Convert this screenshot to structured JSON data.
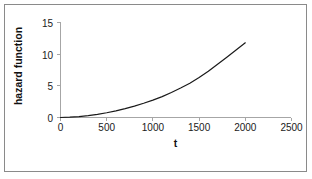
{
  "figure": {
    "border_color": "#8a8a8a",
    "background": "#ffffff"
  },
  "chart_data": {
    "type": "line",
    "title": "",
    "subtitle": "",
    "xlabel": "t",
    "ylabel": "hazard function",
    "xlim": [
      0,
      2500
    ],
    "ylim": [
      0,
      15
    ],
    "xticks": [
      0,
      500,
      1000,
      1500,
      2000,
      2500
    ],
    "xtick_labels": [
      "0",
      "500",
      "1000",
      "1500",
      "2000",
      "2500"
    ],
    "yticks": [
      0,
      5,
      10,
      15
    ],
    "ytick_labels": [
      "0",
      "5",
      "10",
      "15"
    ],
    "grid": false,
    "legend": null,
    "legend_position": "none",
    "annotations": [],
    "series": [
      {
        "name": "hazard function",
        "color": "#1a1a1a",
        "line_width": 1.2,
        "x": [
          0,
          100,
          200,
          300,
          400,
          500,
          600,
          700,
          800,
          900,
          1000,
          1100,
          1200,
          1300,
          1400,
          1500,
          1600,
          1700,
          1800,
          1900,
          2000
        ],
        "values": [
          0.0,
          0.05,
          0.15,
          0.3,
          0.5,
          0.75,
          1.05,
          1.4,
          1.8,
          2.25,
          2.75,
          3.3,
          3.95,
          4.65,
          5.4,
          6.3,
          7.3,
          8.4,
          9.5,
          10.65,
          11.8
        ]
      }
    ]
  },
  "axes": {
    "tick_color": "#a6a6a6",
    "text_color": "#1a1a1a"
  }
}
